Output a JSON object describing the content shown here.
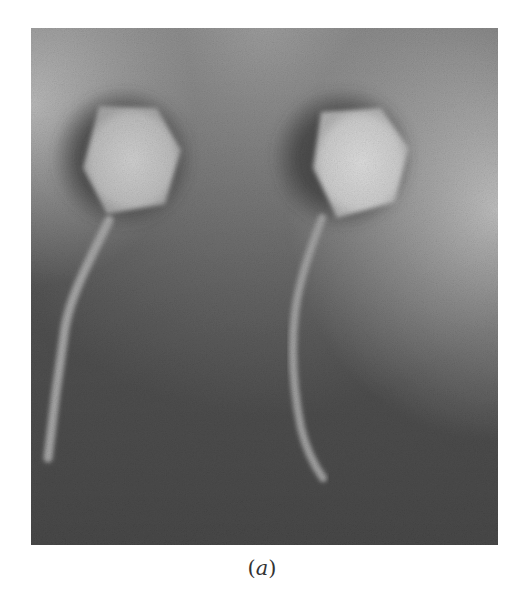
{
  "figure": {
    "label_open": "(",
    "label_letter": "a",
    "label_close": ")",
    "colors": {
      "background_dark": "#595959",
      "background_mid": "#7a7a7a",
      "background_light": "#bdbdbd",
      "head_fill": "#c9c9c9",
      "head_halo": "#4a4a4a",
      "tail_fill": "#a8a8a8",
      "page": "#ffffff"
    }
  }
}
